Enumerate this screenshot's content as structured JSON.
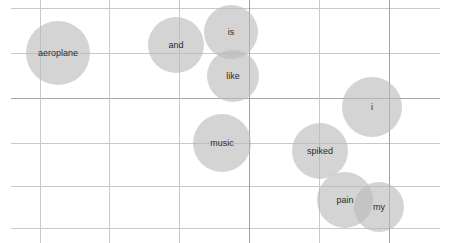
{
  "chart_data": {
    "type": "scatter",
    "title": "",
    "subtitle": "",
    "xlabel": "",
    "ylabel": "",
    "grid": true,
    "legend": "none",
    "axis_ticks_visible": false,
    "marker_shape": "circle",
    "marker_fill": "#b9b9b9",
    "marker_opacity": 0.62,
    "label_color": "#2b2b2b",
    "plot_background": "#ffffff",
    "gridline_color": "#c9c9c9",
    "gridline_color_strong": "#a0a0a0",
    "xlim": [
      11,
      440
    ],
    "ylim": [
      8,
      228
    ],
    "x_gridlines": [
      40,
      109,
      179,
      249,
      319,
      389
    ],
    "y_gridlines": [
      8,
      53,
      98,
      143,
      186,
      228
    ],
    "points": [
      {
        "label": "aeroplane",
        "x": 58,
        "y": 53,
        "r": 32
      },
      {
        "label": "and",
        "x": 176,
        "y": 45,
        "r": 28
      },
      {
        "label": "is",
        "x": 231,
        "y": 32,
        "r": 27
      },
      {
        "label": "like",
        "x": 233,
        "y": 76,
        "r": 26
      },
      {
        "label": "i",
        "x": 372,
        "y": 107,
        "r": 30
      },
      {
        "label": "music",
        "x": 222,
        "y": 143,
        "r": 29
      },
      {
        "label": "spiked",
        "x": 320,
        "y": 151,
        "r": 28
      },
      {
        "label": "pain",
        "x": 345,
        "y": 200,
        "r": 28
      },
      {
        "label": "my",
        "x": 379,
        "y": 207,
        "r": 25
      }
    ]
  },
  "footer": {
    "watermark": ""
  }
}
